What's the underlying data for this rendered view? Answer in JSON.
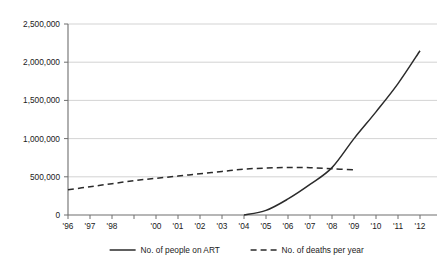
{
  "chart_data": {
    "type": "line",
    "title": "",
    "subtitle": "",
    "xlabel": "",
    "ylabel": "",
    "grid": true,
    "legend_position": "bottom",
    "xlim": [
      1996,
      2012
    ],
    "ylim": [
      0,
      2500000
    ],
    "y_ticks": [
      0,
      500000,
      1000000,
      1500000,
      2000000,
      2500000
    ],
    "y_tick_labels": [
      "0",
      "500,000",
      "1,000,000",
      "1,500,000",
      "2,000,000",
      "2,500,000"
    ],
    "x": [
      1996,
      1997,
      1998,
      1999,
      2000,
      2001,
      2002,
      2003,
      2004,
      2005,
      2006,
      2007,
      2008,
      2009,
      2010,
      2011,
      2012
    ],
    "x_tick_labels": [
      "'96",
      "'97",
      "'98",
      "",
      "'00",
      "'01",
      "'02",
      "'03",
      "'04",
      "'05",
      "'06",
      "'07",
      "'08",
      "'09",
      "'10",
      "'11",
      "'12"
    ],
    "series": [
      {
        "name": "No. of people on ART",
        "style": "solid",
        "color": "#2b2b2b",
        "x": [
          2004,
          2005,
          2006,
          2007,
          2008,
          2009,
          2010,
          2011,
          2012
        ],
        "values": [
          0,
          60000,
          210000,
          400000,
          620000,
          1000000,
          1350000,
          1720000,
          2150000
        ]
      },
      {
        "name": "No. of deaths per year",
        "style": "dashed",
        "color": "#2b2b2b",
        "x": [
          1996,
          1997,
          1998,
          1999,
          2000,
          2001,
          2002,
          2003,
          2004,
          2005,
          2006,
          2007,
          2008,
          2009
        ],
        "values": [
          330000,
          370000,
          410000,
          450000,
          480000,
          510000,
          540000,
          570000,
          600000,
          615000,
          622000,
          620000,
          605000,
          590000
        ]
      }
    ]
  },
  "legend": {
    "items": [
      {
        "label": "No. of people on ART",
        "style": "solid"
      },
      {
        "label": "No. of deaths per year",
        "style": "dashed"
      }
    ]
  }
}
